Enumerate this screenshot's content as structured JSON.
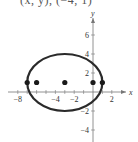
{
  "caption": "(x, y), (−4, 1)",
  "chart_data": {
    "type": "scatter",
    "title": "",
    "xlabel": "x",
    "ylabel": "y",
    "xlim": [
      -9,
      3.5
    ],
    "ylim": [
      -5,
      8
    ],
    "grid": false,
    "x_ticks": [
      -8,
      -4,
      -2,
      2
    ],
    "y_ticks": [
      6,
      4,
      2,
      -2,
      -4
    ],
    "x_tick_labels": [
      "−8",
      "−4",
      "−2",
      "2"
    ],
    "y_tick_labels": [
      "6",
      "4",
      "2",
      "−2",
      "−4"
    ],
    "curves": [
      {
        "name": "ellipse",
        "shape": "ellipse",
        "center": [
          -3,
          1
        ],
        "semi_major_x": 4,
        "semi_minor_y": 3,
        "equation": "(x+3)^2/16 + (y-1)^2/9 = 1"
      }
    ],
    "points": [
      {
        "x": -7,
        "y": 1,
        "label": "vertex"
      },
      {
        "x": -6,
        "y": 1,
        "label": "focus"
      },
      {
        "x": -3,
        "y": 1,
        "label": "center"
      },
      {
        "x": 0,
        "y": 1,
        "label": "focus"
      },
      {
        "x": 1,
        "y": 1,
        "label": "vertex"
      }
    ],
    "colors": {
      "curve": "#2a2a2a",
      "points": "#1a1a1a",
      "axes": "#777777"
    }
  }
}
